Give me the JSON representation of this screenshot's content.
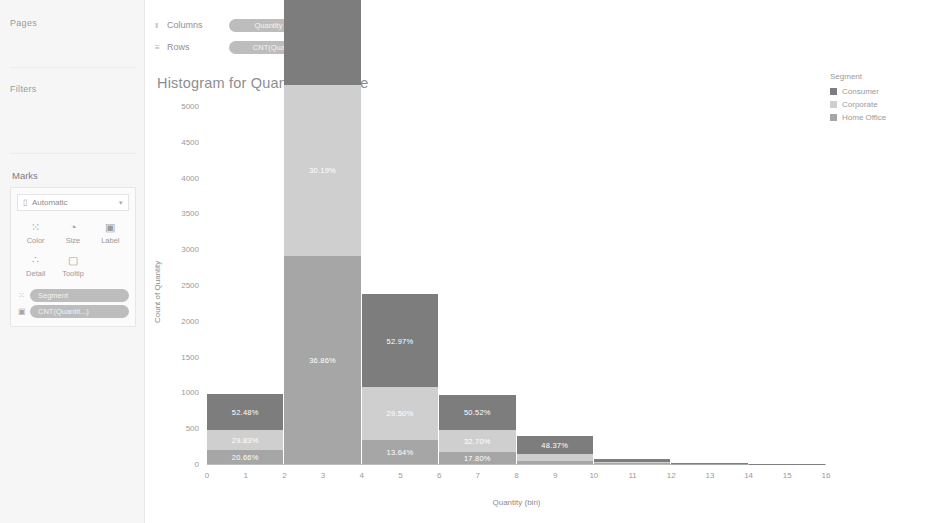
{
  "sidebar": {
    "pages_label": "Pages",
    "filters_label": "Filters",
    "marks_label": "Marks",
    "mark_type": {
      "label": "Automatic",
      "icon": "bar-mark-icon",
      "caret": "▾"
    },
    "mark_buttons": [
      {
        "name": "color",
        "caption": "Color",
        "glyph": "⁙"
      },
      {
        "name": "size",
        "caption": "Size",
        "glyph": "◔"
      },
      {
        "name": "label",
        "caption": "Label",
        "glyph": "▣"
      },
      {
        "name": "detail",
        "caption": "Detail",
        "glyph": "∴"
      },
      {
        "name": "tooltip",
        "caption": "Tooltip",
        "glyph": "▢"
      }
    ],
    "mark_pills": [
      {
        "glyph": "⁙",
        "label": "Segment"
      },
      {
        "glyph": "▣",
        "label": "CNT(Quantit...)"
      }
    ]
  },
  "shelves": [
    {
      "glyph": "‖",
      "name": "Columns",
      "pill": "Quantity (bin)"
    },
    {
      "glyph": "≡",
      "name": "Rows",
      "pill": "CNT(Quantity)"
    }
  ],
  "viz": {
    "title": "Histogram for Quantity Measure"
  },
  "legend": {
    "title": "Segment",
    "items": [
      {
        "label": "Consumer",
        "color": "#7d7d7d"
      },
      {
        "label": "Corporate",
        "color": "#cfcfcf"
      },
      {
        "label": "Home Office",
        "color": "#a6a6a6"
      }
    ]
  },
  "chart_data": {
    "type": "bar",
    "title": "Histogram for Quantity Measure",
    "xlabel": "Quantity (bin)",
    "ylabel": "Count of Quantity",
    "stacked": true,
    "grid": false,
    "legend_position": "right",
    "legend_title": "Segment",
    "xlim": [
      0,
      16
    ],
    "ylim": [
      0,
      5000
    ],
    "xticks": [
      0,
      1,
      2,
      3,
      4,
      5,
      6,
      7,
      8,
      9,
      10,
      11,
      12,
      13,
      14,
      15,
      16
    ],
    "yticks": [
      0,
      500,
      1000,
      1500,
      2000,
      2500,
      3000,
      3500,
      4000,
      4500,
      5000
    ],
    "categories": [
      0,
      2,
      4,
      6,
      8,
      10,
      12,
      14
    ],
    "series": [
      {
        "name": "Consumer",
        "color": "#7d7d7d",
        "values": [
          500,
          2600,
          1300,
          480,
          255,
          42,
          10,
          3
        ]
      },
      {
        "name": "Corporate",
        "color": "#cfcfcf",
        "values": [
          285,
          2380,
          735,
          310,
          95,
          14,
          4,
          1
        ]
      },
      {
        "name": "Home Office",
        "color": "#a6a6a6",
        "values": [
          197,
          2910,
          340,
          170,
          40,
          8,
          2,
          1
        ]
      }
    ],
    "bar_totals": [
      982,
      7890,
      2375,
      960,
      390,
      64,
      16,
      5
    ],
    "bars": [
      {
        "bin": 0,
        "segments": [
          {
            "name": "Consumer",
            "label": "52.48%",
            "value": 500
          },
          {
            "name": "Corporate",
            "label": "29.83%",
            "value": 285
          },
          {
            "name": "Home Office",
            "label": "20.66%",
            "value": 197
          }
        ]
      },
      {
        "bin": 2,
        "segments": [
          {
            "name": "Consumer",
            "label": "32.94%",
            "value": 2600
          },
          {
            "name": "Corporate",
            "label": "30.19%",
            "value": 2380
          },
          {
            "name": "Home Office",
            "label": "36.86%",
            "value": 2910
          }
        ]
      },
      {
        "bin": 4,
        "segments": [
          {
            "name": "Consumer",
            "label": "52.97%",
            "value": 1300
          },
          {
            "name": "Corporate",
            "label": "29.50%",
            "value": 735
          },
          {
            "name": "Home Office",
            "label": "13.64%",
            "value": 340
          }
        ]
      },
      {
        "bin": 6,
        "segments": [
          {
            "name": "Consumer",
            "label": "50.52%",
            "value": 480
          },
          {
            "name": "Corporate",
            "label": "32.70%",
            "value": 310
          },
          {
            "name": "Home Office",
            "label": "17.80%",
            "value": 170
          }
        ]
      },
      {
        "bin": 8,
        "segments": [
          {
            "name": "Consumer",
            "label": "48.37%",
            "value": 255
          },
          {
            "name": "Corporate",
            "label": "",
            "value": 95
          },
          {
            "name": "Home Office",
            "label": "",
            "value": 40
          }
        ]
      },
      {
        "bin": 10,
        "segments": [
          {
            "name": "Consumer",
            "label": "",
            "value": 42
          },
          {
            "name": "Corporate",
            "label": "",
            "value": 14
          },
          {
            "name": "Home Office",
            "label": "",
            "value": 8
          }
        ]
      },
      {
        "bin": 12,
        "segments": [
          {
            "name": "Consumer",
            "label": "",
            "value": 10
          },
          {
            "name": "Corporate",
            "label": "",
            "value": 4
          },
          {
            "name": "Home Office",
            "label": "",
            "value": 2
          }
        ]
      },
      {
        "bin": 14,
        "segments": [
          {
            "name": "Consumer",
            "label": "",
            "value": 3
          },
          {
            "name": "Corporate",
            "label": "",
            "value": 1
          },
          {
            "name": "Home Office",
            "label": "",
            "value": 1
          }
        ]
      }
    ]
  }
}
